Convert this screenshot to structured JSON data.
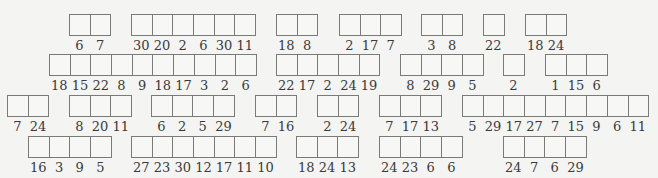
{
  "rows": [
    {
      "groups": [
        {
          "values": [
            "6",
            "7"
          ]
        },
        {
          "values": [
            "30",
            "20",
            "2",
            "6",
            "30",
            "11"
          ]
        },
        {
          "values": [
            "18",
            "8"
          ]
        },
        {
          "values": [
            "2",
            "17",
            "7"
          ]
        },
        {
          "values": [
            "3",
            "8"
          ]
        },
        {
          "values": [
            "22"
          ]
        },
        {
          "values": [
            "18",
            "24"
          ]
        }
      ]
    },
    {
      "groups": [
        {
          "values": [
            "18",
            "15",
            "22",
            "8",
            "9",
            "18",
            "17",
            "3",
            "2",
            "6"
          ]
        },
        {
          "values": [
            "22",
            "17",
            "2",
            "24",
            "19"
          ]
        },
        {
          "values": [
            "8",
            "29",
            "9",
            "5"
          ]
        },
        {
          "values": [
            "2"
          ]
        },
        {
          "values": [
            "1",
            "15",
            "6"
          ]
        }
      ]
    },
    {
      "groups": [
        {
          "values": [
            "7",
            "24"
          ]
        },
        {
          "values": [
            "8",
            "20",
            "11"
          ]
        },
        {
          "values": [
            "6",
            "2",
            "5",
            "29"
          ]
        },
        {
          "values": [
            "7",
            "16"
          ]
        },
        {
          "values": [
            "2",
            "24"
          ]
        },
        {
          "values": [
            "7",
            "17",
            "13"
          ]
        },
        {
          "values": [
            "5",
            "29",
            "17",
            "27",
            "7",
            "15",
            "9",
            "6",
            "11"
          ]
        }
      ]
    },
    {
      "groups": [
        {
          "values": [
            "16",
            "3",
            "9",
            "5"
          ]
        },
        {
          "values": [
            "27",
            "23",
            "30",
            "12",
            "17",
            "11",
            "10"
          ]
        },
        {
          "values": [
            "18",
            "24",
            "13"
          ]
        },
        {
          "values": [
            "24",
            "23",
            "6",
            "6"
          ]
        },
        {
          "values": [
            "24",
            "7",
            "6",
            "29"
          ]
        }
      ]
    }
  ]
}
